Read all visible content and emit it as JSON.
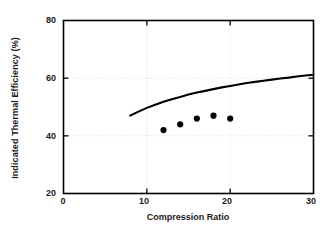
{
  "chart_data": {
    "type": "scatter",
    "title": "",
    "xlabel": "Compression Ratio",
    "ylabel": "Indicated Thermal Efficiency (%)",
    "xlim": [
      0,
      30
    ],
    "ylim": [
      20,
      80
    ],
    "xticks": [
      0,
      10,
      20,
      30
    ],
    "yticks": [
      20,
      40,
      60,
      80
    ],
    "xtick_labels": [
      "0",
      "10",
      "20",
      "30"
    ],
    "ytick_labels": [
      "20",
      "40",
      "60",
      "80"
    ],
    "grid": true,
    "legend": "none",
    "series": [
      {
        "name": "Theoretical thermal efficiency",
        "type": "line",
        "color": "#000000",
        "x": [
          8,
          9,
          10,
          11,
          12,
          13,
          14,
          15,
          16,
          17,
          18,
          19,
          20,
          21,
          22,
          23,
          24,
          25,
          26,
          27,
          28,
          29,
          30
        ],
        "values": [
          47.0,
          48.4,
          49.7,
          50.8,
          51.8,
          52.7,
          53.5,
          54.3,
          55.0,
          55.6,
          56.2,
          56.8,
          57.3,
          57.8,
          58.3,
          58.7,
          59.1,
          59.5,
          59.9,
          60.2,
          60.6,
          60.9,
          61.2
        ]
      },
      {
        "name": "Measured indicated thermal efficiency",
        "type": "scatter",
        "marker": "circle",
        "color": "#000000",
        "x": [
          12,
          14,
          16,
          18,
          20
        ],
        "values": [
          42,
          44,
          46,
          47,
          46
        ]
      }
    ]
  }
}
